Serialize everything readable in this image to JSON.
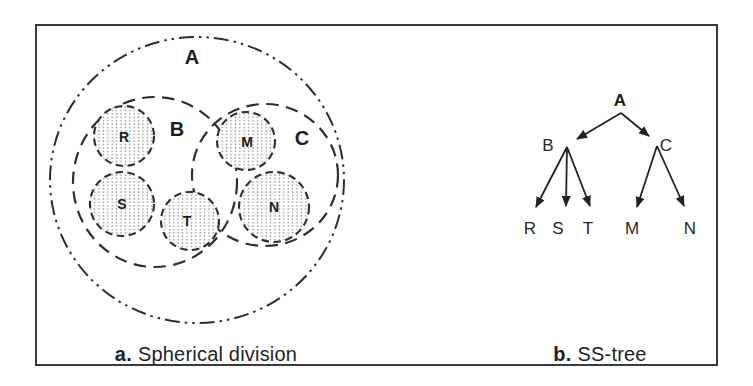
{
  "colors": {
    "line": "#2e2e2e",
    "frame": "#3a3a3a",
    "stipple_dot": "#999999",
    "background": "#ffffff",
    "text": "#1c1c1c"
  },
  "panel_a": {
    "caption_prefix": "a.",
    "caption_label": "Spherical division",
    "root_sphere": "A",
    "inner_spheres": [
      "B",
      "C"
    ],
    "leaf_spheres": [
      "R",
      "S",
      "T",
      "M",
      "N"
    ]
  },
  "panel_b": {
    "caption_prefix": "b.",
    "caption_label": "SS-tree",
    "tree": {
      "root": "A",
      "internal_nodes": [
        "B",
        "C"
      ],
      "leaves": [
        "R",
        "S",
        "T",
        "M",
        "N"
      ],
      "edges": [
        "A→B",
        "A→C",
        "B→R",
        "B→S",
        "B→T",
        "C→M",
        "C→N"
      ]
    }
  }
}
